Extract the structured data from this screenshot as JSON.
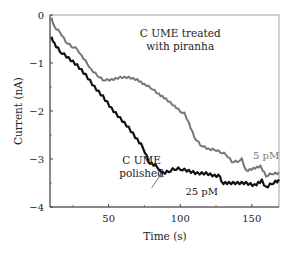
{
  "chart_data": {
    "type": "line",
    "title": "",
    "xlabel": "Time (s)",
    "ylabel": "Current (nA)",
    "xlim": [
      9,
      169
    ],
    "ylim": [
      -4,
      0
    ],
    "xticks": [
      50,
      100,
      150
    ],
    "xtick_labels": [
      "50",
      "100",
      "150"
    ],
    "yticks": [
      0,
      -1,
      -2,
      -3,
      -4
    ],
    "ytick_labels": [
      "0",
      "−1",
      "−2",
      "−3",
      "−4"
    ],
    "grid": false,
    "legend": null,
    "series": [
      {
        "name": "C UME treated with piranha (5 pM)",
        "color": "#777777",
        "x": [
          10,
          12,
          16,
          20,
          24,
          28,
          31,
          35,
          38,
          42,
          46,
          52,
          58,
          64,
          70,
          75,
          79,
          85,
          90,
          96,
          100,
          103,
          106,
          110,
          114,
          120,
          124,
          128,
          132,
          136,
          140,
          143,
          146,
          151,
          156,
          160,
          164,
          169
        ],
        "y": [
          -0.05,
          -0.25,
          -0.35,
          -0.55,
          -0.65,
          -0.7,
          -0.85,
          -1.0,
          -1.15,
          -1.25,
          -1.35,
          -1.35,
          -1.3,
          -1.3,
          -1.35,
          -1.45,
          -1.5,
          -1.65,
          -1.75,
          -1.9,
          -2.0,
          -2.05,
          -2.25,
          -2.55,
          -2.7,
          -2.8,
          -2.8,
          -2.85,
          -2.9,
          -3.05,
          -3.05,
          -3.0,
          -3.25,
          -3.2,
          -3.15,
          -3.35,
          -3.3,
          -3.3
        ]
      },
      {
        "name": "C UME polished (25 pM)",
        "color": "#111111",
        "x": [
          10,
          12,
          16,
          22,
          28,
          34,
          40,
          46,
          52,
          58,
          64,
          70,
          74,
          78,
          80,
          84,
          86,
          88,
          92,
          96,
          100,
          106,
          112,
          118,
          124,
          128,
          129,
          134,
          140,
          146,
          152,
          157,
          160,
          164,
          169
        ],
        "y": [
          -0.45,
          -0.6,
          -0.75,
          -0.9,
          -1.05,
          -1.25,
          -1.5,
          -1.7,
          -1.95,
          -2.15,
          -2.35,
          -2.6,
          -2.75,
          -3.05,
          -3.1,
          -3.15,
          -3.25,
          -3.3,
          -3.25,
          -3.2,
          -3.2,
          -3.25,
          -3.3,
          -3.3,
          -3.35,
          -3.35,
          -3.5,
          -3.5,
          -3.5,
          -3.5,
          -3.55,
          -3.45,
          -3.6,
          -3.5,
          -3.45
        ]
      }
    ],
    "annotations": [
      {
        "text": "C UME treated",
        "x": 100,
        "y": -0.45
      },
      {
        "text": "with piranha",
        "x": 100,
        "y": -0.72
      },
      {
        "text": "C UME",
        "x": 73,
        "y": -3.1
      },
      {
        "text": "polished",
        "x": 73,
        "y": -3.38
      },
      {
        "text": "5 pM",
        "x": 160,
        "y": -3.0
      },
      {
        "text": "25 pM",
        "x": 115,
        "y": -3.75
      }
    ],
    "arrow": {
      "from": [
        80,
        -3.6
      ],
      "to": [
        87,
        -3.3
      ]
    }
  }
}
